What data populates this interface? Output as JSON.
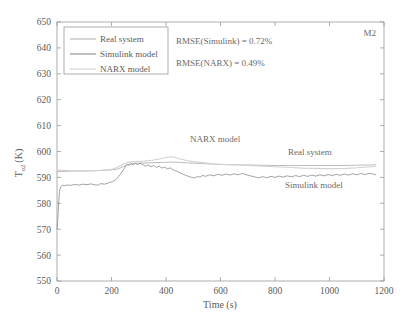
{
  "figure": {
    "panel_label": "M2",
    "background_color": "#ffffff",
    "frame_color": "#9a9a9a"
  },
  "chart_data": {
    "type": "line",
    "title": "",
    "xlabel": "Time (s)",
    "ylabel": "Tₒ₂ (K)",
    "ylabel_base": "T",
    "ylabel_sub": "o2",
    "ylabel_unit": "(K)",
    "xlim": [
      0,
      1200
    ],
    "ylim": [
      550,
      650
    ],
    "xticks": [
      0,
      200,
      400,
      600,
      800,
      1000,
      1200
    ],
    "yticks": [
      550,
      560,
      570,
      580,
      590,
      600,
      610,
      620,
      630,
      640,
      650
    ],
    "grid": false,
    "legend_position": "upper-left-inside",
    "annotations": [
      {
        "name": "rmse-simulink",
        "text": "RMSE(Simulink) = 0.72%"
      },
      {
        "name": "rmse-narx",
        "text": "RMSE(NARX) = 0.49%"
      },
      {
        "name": "label-narx-model",
        "text": "NARX model"
      },
      {
        "name": "label-real-system",
        "text": "Real system"
      },
      {
        "name": "label-simulink-model",
        "text": "Simulink model"
      },
      {
        "name": "panel-id",
        "text": "M2"
      }
    ],
    "series": [
      {
        "name": "Real system",
        "color": "#b4b4b4",
        "width": 0.9,
        "x": [
          0,
          12,
          25,
          40,
          60,
          85,
          110,
          140,
          170,
          200,
          225,
          240,
          255,
          270,
          290,
          310,
          335,
          360,
          390,
          420,
          450,
          480,
          520,
          560,
          600,
          650,
          700,
          750,
          800,
          850,
          900,
          950,
          1000,
          1050,
          1100,
          1150,
          1170
        ],
        "values": [
          592.2,
          592.3,
          592.3,
          592.4,
          592.4,
          592.5,
          592.5,
          592.6,
          592.7,
          592.9,
          593.3,
          594.0,
          594.8,
          595.2,
          595.4,
          595.5,
          595.6,
          595.7,
          595.8,
          595.9,
          595.8,
          595.6,
          595.4,
          595.2,
          595.0,
          594.9,
          594.8,
          594.7,
          594.6,
          594.6,
          594.6,
          594.6,
          594.6,
          594.6,
          594.7,
          594.8,
          594.9
        ]
      },
      {
        "name": "Simulink model",
        "color": "#8c8c8c",
        "width": 0.8,
        "x": [
          0,
          3,
          6,
          9,
          14,
          20,
          28,
          38,
          50,
          65,
          80,
          95,
          110,
          125,
          140,
          150,
          160,
          175,
          190,
          205,
          215,
          225,
          235,
          245,
          252,
          258,
          265,
          272,
          280,
          288,
          296,
          305,
          315,
          325,
          335,
          345,
          355,
          365,
          375,
          385,
          395,
          405,
          415,
          425,
          435,
          445,
          455,
          465,
          475,
          485,
          495,
          505,
          515,
          525,
          535,
          545,
          560,
          575,
          590,
          605,
          620,
          635,
          650,
          665,
          680,
          695,
          710,
          725,
          740,
          755,
          770,
          785,
          800,
          815,
          830,
          845,
          860,
          875,
          890,
          905,
          920,
          935,
          950,
          965,
          980,
          995,
          1010,
          1025,
          1040,
          1055,
          1070,
          1085,
          1100,
          1115,
          1130,
          1145,
          1160,
          1170
        ],
        "values": [
          570.0,
          574.0,
          580.0,
          584.5,
          586.5,
          587.0,
          586.8,
          587.1,
          586.9,
          587.3,
          587.0,
          587.4,
          587.2,
          587.5,
          587.1,
          587.0,
          587.6,
          587.4,
          587.9,
          588.4,
          589.1,
          590.2,
          591.6,
          593.2,
          594.4,
          595.0,
          594.6,
          595.3,
          594.8,
          595.4,
          594.9,
          595.5,
          594.9,
          594.3,
          594.8,
          594.1,
          594.6,
          593.9,
          594.3,
          593.6,
          594.0,
          593.3,
          593.7,
          593.0,
          592.6,
          592.1,
          591.6,
          591.1,
          590.7,
          590.3,
          590.0,
          589.8,
          590.4,
          590.1,
          590.8,
          590.4,
          591.0,
          590.6,
          591.2,
          590.8,
          591.3,
          590.9,
          591.4,
          591.0,
          591.5,
          591.0,
          590.6,
          590.2,
          589.8,
          590.3,
          589.9,
          590.4,
          590.0,
          590.5,
          590.1,
          590.6,
          590.2,
          590.7,
          590.3,
          590.8,
          590.4,
          590.9,
          590.5,
          591.0,
          590.6,
          591.1,
          590.7,
          591.2,
          590.8,
          591.3,
          590.9,
          591.4,
          591.0,
          591.5,
          591.1,
          591.6,
          591.3,
          591.0
        ]
      },
      {
        "name": "NARX model",
        "color": "#d2d2d2",
        "width": 1.1,
        "x": [
          0,
          20,
          45,
          70,
          100,
          130,
          160,
          185,
          205,
          220,
          235,
          248,
          260,
          275,
          290,
          305,
          320,
          340,
          360,
          380,
          395,
          410,
          420,
          430,
          445,
          460,
          480,
          500,
          525,
          550,
          580,
          610,
          640,
          670,
          700,
          740,
          780,
          820,
          860,
          900,
          940,
          980,
          1020,
          1060,
          1100,
          1140,
          1170
        ],
        "values": [
          592.8,
          592.7,
          592.6,
          592.5,
          592.5,
          592.6,
          592.7,
          592.9,
          593.2,
          593.8,
          594.6,
          595.4,
          595.8,
          596.0,
          596.1,
          596.2,
          596.3,
          596.5,
          596.8,
          597.2,
          597.6,
          597.9,
          598.0,
          597.8,
          597.3,
          596.9,
          596.4,
          596.1,
          595.8,
          595.5,
          595.2,
          595.0,
          594.9,
          594.8,
          594.6,
          594.4,
          594.2,
          594.0,
          593.8,
          593.6,
          593.5,
          593.4,
          593.4,
          593.5,
          593.7,
          594.0,
          594.2
        ]
      }
    ]
  },
  "legend": {
    "entries": [
      {
        "label": "Real system",
        "color": "#b4b4b4"
      },
      {
        "label": "Simulink model",
        "color": "#8c8c8c"
      },
      {
        "label": "NARX model",
        "color": "#d2d2d2"
      }
    ]
  }
}
